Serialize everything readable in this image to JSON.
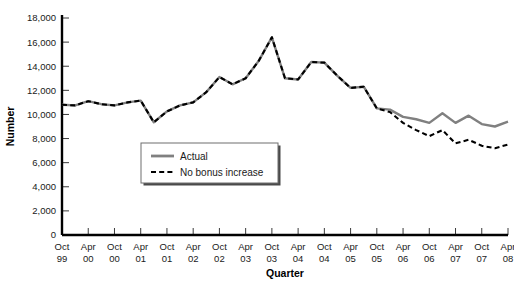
{
  "chart_data": {
    "type": "line",
    "title": "",
    "xlabel": "Quarter",
    "ylabel": "Number",
    "ylim": [
      0,
      18000
    ],
    "ytick_values": [
      0,
      2000,
      4000,
      6000,
      8000,
      10000,
      12000,
      14000,
      16000,
      18000
    ],
    "ytick_labels": [
      "0",
      "2,000",
      "4,000",
      "6,000",
      "8,000",
      "10,000",
      "12,000",
      "14,000",
      "16,000",
      "18,000"
    ],
    "grid": false,
    "legend_position": "center-left-inside",
    "xtick_labels": [
      {
        "line1": "Oct",
        "line2": "99"
      },
      {
        "line1": "Apr",
        "line2": "00"
      },
      {
        "line1": "Oct",
        "line2": "00"
      },
      {
        "line1": "Apr",
        "line2": "01"
      },
      {
        "line1": "Oct",
        "line2": "01"
      },
      {
        "line1": "Apr",
        "line2": "02"
      },
      {
        "line1": "Oct",
        "line2": "02"
      },
      {
        "line1": "Apr",
        "line2": "03"
      },
      {
        "line1": "Oct",
        "line2": "03"
      },
      {
        "line1": "Apr",
        "line2": "04"
      },
      {
        "line1": "Oct",
        "line2": "04"
      },
      {
        "line1": "Apr",
        "line2": "05"
      },
      {
        "line1": "Oct",
        "line2": "05"
      },
      {
        "line1": "Apr",
        "line2": "06"
      },
      {
        "line1": "Oct",
        "line2": "06"
      },
      {
        "line1": "Apr",
        "line2": "07"
      },
      {
        "line1": "Oct",
        "line2": "07"
      },
      {
        "line1": "Apr",
        "line2": "08"
      }
    ],
    "x": [
      "Oct 99",
      "Jan 00",
      "Apr 00",
      "Jul 00",
      "Oct 00",
      "Jan 01",
      "Apr 01",
      "Jul 01",
      "Oct 01",
      "Jan 02",
      "Apr 02",
      "Jul 02",
      "Oct 02",
      "Jan 03",
      "Apr 03",
      "Jul 03",
      "Oct 03",
      "Jan 04",
      "Apr 04",
      "Jul 04",
      "Oct 04",
      "Jan 05",
      "Apr 05",
      "Jul 05",
      "Oct 05",
      "Jan 06",
      "Apr 06",
      "Jul 06",
      "Oct 06",
      "Jan 07",
      "Apr 07",
      "Jul 07",
      "Oct 07",
      "Jan 08",
      "Apr 08"
    ],
    "series": [
      {
        "name": "Actual",
        "color": "#808080",
        "style": "solid",
        "values": [
          10800,
          10750,
          11100,
          10850,
          10750,
          11000,
          11150,
          9350,
          10250,
          10750,
          11000,
          11850,
          13100,
          12500,
          13000,
          14450,
          16400,
          13000,
          12900,
          14350,
          14300,
          13200,
          12200,
          12300,
          10500,
          10400,
          9800,
          9600,
          9300,
          10100,
          9300,
          9900,
          9200,
          9000,
          9400
        ]
      },
      {
        "name": "No bonus increase",
        "color": "#000000",
        "style": "dashed",
        "values": [
          10800,
          10750,
          11100,
          10850,
          10750,
          11000,
          11150,
          9350,
          10250,
          10750,
          11000,
          11850,
          13100,
          12500,
          13000,
          14450,
          16400,
          13000,
          12900,
          14350,
          14300,
          13200,
          12200,
          12300,
          10500,
          10200,
          9300,
          8700,
          8200,
          8700,
          7600,
          7900,
          7400,
          7200,
          7500
        ]
      }
    ],
    "series_detailed": {
      "actual": [
        {
          "q": "Oct 99",
          "v": 10800
        },
        {
          "q": "Jan 00",
          "v": 10750
        },
        {
          "q": "Apr 00",
          "v": 11100
        },
        {
          "q": "Jul 00",
          "v": 10850
        },
        {
          "q": "Oct 00",
          "v": 10750
        },
        {
          "q": "Jan 01",
          "v": 11000
        },
        {
          "q": "Apr 01",
          "v": 11150
        },
        {
          "q": "Jul 01",
          "v": 9350
        },
        {
          "q": "Oct 01",
          "v": 10250
        },
        {
          "q": "Jan 02",
          "v": 10750
        },
        {
          "q": "Apr 02",
          "v": 11000
        },
        {
          "q": "Jul 02",
          "v": 11850
        },
        {
          "q": "Oct 02",
          "v": 13100
        },
        {
          "q": "Jan 03",
          "v": 12500
        },
        {
          "q": "Apr 03",
          "v": 13000
        },
        {
          "q": "Jul 03",
          "v": 14450
        },
        {
          "q": "Oct 03",
          "v": 16400
        },
        {
          "q": "Jan 04",
          "v": 13000
        },
        {
          "q": "Apr 04",
          "v": 12900
        },
        {
          "q": "Jul 04",
          "v": 14350
        },
        {
          "q": "Oct 04",
          "v": 14300
        },
        {
          "q": "Jan 05",
          "v": 13200
        },
        {
          "q": "Apr 05",
          "v": 12200
        },
        {
          "q": "Jul 05",
          "v": 12300
        },
        {
          "q": "Oct 05",
          "v": 10500
        },
        {
          "q": "Jan 06",
          "v": 10400
        },
        {
          "q": "Apr 06",
          "v": 9800
        },
        {
          "q": "Jul 06",
          "v": 9600
        },
        {
          "q": "Oct 06",
          "v": 9300
        },
        {
          "q": "Jan 07",
          "v": 10100
        },
        {
          "q": "Apr 07",
          "v": 9300
        },
        {
          "q": "Jul 07",
          "v": 9900
        },
        {
          "q": "Oct 07",
          "v": 9200
        },
        {
          "q": "Jan 08",
          "v": 9000
        },
        {
          "q": "Apr 08",
          "v": 9400
        }
      ]
    }
  },
  "legend": {
    "items": [
      {
        "label": "Actual",
        "color": "#808080",
        "style": "solid"
      },
      {
        "label": "No bonus increase",
        "color": "#000000",
        "style": "dashed"
      }
    ]
  }
}
